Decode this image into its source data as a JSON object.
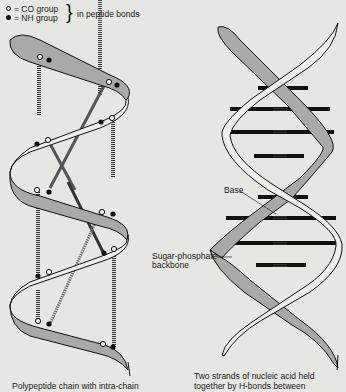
{
  "legend": {
    "items": [
      {
        "symbol": "open-circle",
        "label": "= CO group"
      },
      {
        "symbol": "filled-circle",
        "label": "= NH group"
      }
    ],
    "brace_label": "in peptide bonds"
  },
  "labels": {
    "base": "Base",
    "backbone_line1": "Sugar-phosphate",
    "backbone_line2": "backbone"
  },
  "captions": {
    "left": "Polypeptide chain with intra-chain",
    "right_line1": "Two strands of nucleic acid held",
    "right_line2": "together by H-bonds between"
  },
  "colors": {
    "background": "#e6e6e3",
    "ribbon_shaded": "#a9a9a6",
    "ribbon_light": "#eeeeec",
    "outline": "#111111"
  }
}
